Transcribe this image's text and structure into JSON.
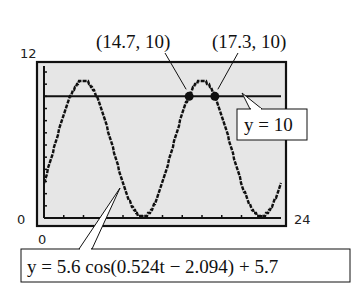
{
  "chart_data": {
    "type": "line",
    "title": "",
    "xlabel": "",
    "ylabel": "",
    "xlim": [
      0,
      24
    ],
    "ylim": [
      0,
      12
    ],
    "x_tick_step": 2,
    "y_tick_step": 1,
    "grid": false,
    "window_labels": {
      "ymax": "12",
      "ymin": "0",
      "xmin": "0",
      "xmax": "24"
    },
    "series": [
      {
        "name": "y = 5.6 cos(0.524t − 2.094) + 5.7",
        "function": {
          "amplitude": 5.6,
          "frequency": 0.524,
          "phase": 2.094,
          "offset": 5.7
        },
        "style": "stepped"
      },
      {
        "name": "y = 10",
        "constant": 10
      }
    ],
    "points": [
      {
        "x": 14.7,
        "y": 10,
        "label": "(14.7, 10)"
      },
      {
        "x": 17.3,
        "y": 10,
        "label": "(17.3, 10)"
      }
    ],
    "annotations": {
      "hline_label": "y = 10",
      "curve_label": "y = 5.6 cos(0.524t − 2.094) + 5.7"
    },
    "colors": {
      "plot_bg": "#e6e6e6",
      "ink": "#111111"
    }
  }
}
